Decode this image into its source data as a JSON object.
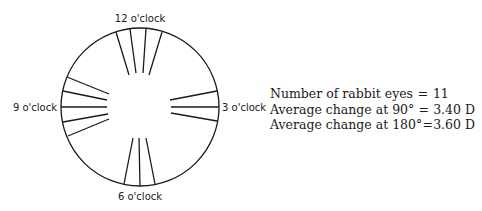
{
  "diagram": {
    "circle": {
      "cx": 140,
      "cy": 107,
      "r": 79,
      "stroke": "#1a1a1a"
    },
    "labels": {
      "top": "12 o'clock",
      "left": "9 o'clock",
      "right": "3 o'clock",
      "bottom": "6 o'clock"
    },
    "incisions": {
      "top": [
        {
          "x1": 116,
          "y1": 32,
          "x2": 129,
          "y2": 75
        },
        {
          "x1": 130,
          "y1": 29,
          "x2": 136,
          "y2": 73
        },
        {
          "x1": 146,
          "y1": 29,
          "x2": 143,
          "y2": 73
        },
        {
          "x1": 162,
          "y1": 32,
          "x2": 149,
          "y2": 75
        }
      ],
      "left": [
        {
          "x1": 67,
          "y1": 77,
          "x2": 109,
          "y2": 94
        },
        {
          "x1": 63,
          "y1": 91,
          "x2": 107,
          "y2": 100
        },
        {
          "x1": 61,
          "y1": 107,
          "x2": 107,
          "y2": 107
        },
        {
          "x1": 63,
          "y1": 122,
          "x2": 108,
          "y2": 114
        },
        {
          "x1": 68,
          "y1": 136,
          "x2": 109,
          "y2": 119
        }
      ],
      "right": [
        {
          "x1": 217,
          "y1": 91,
          "x2": 170,
          "y2": 100
        },
        {
          "x1": 219,
          "y1": 107,
          "x2": 171,
          "y2": 107
        },
        {
          "x1": 217,
          "y1": 121,
          "x2": 171,
          "y2": 113
        }
      ],
      "bottom": [
        {
          "x1": 124,
          "y1": 184,
          "x2": 133,
          "y2": 138
        },
        {
          "x1": 140,
          "y1": 186,
          "x2": 139,
          "y2": 138
        },
        {
          "x1": 155,
          "y1": 184,
          "x2": 146,
          "y2": 138
        }
      ]
    }
  },
  "stats": [
    {
      "label": "Number of rabbit eyes",
      "eq": "=",
      "value": "11"
    },
    {
      "label": "Average change at 90°",
      "eq": "=",
      "value": "3.40 D"
    },
    {
      "label": "Average change at 180°",
      "eq": "=",
      "value": "3.60 D"
    }
  ]
}
